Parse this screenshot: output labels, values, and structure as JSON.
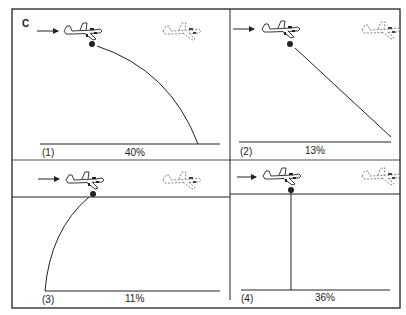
{
  "figure": {
    "corner_label": "C",
    "colors": {
      "line": "#222222",
      "background": "#ffffff",
      "ghost_plane": "#666666"
    }
  },
  "panels": [
    {
      "index": "(1)",
      "percent": "40%",
      "trajectory": "forward-arc",
      "icon": "airplane-icon"
    },
    {
      "index": "(2)",
      "percent": "13%",
      "trajectory": "forward-straight-diagonal",
      "icon": "airplane-icon"
    },
    {
      "index": "(3)",
      "percent": "11%",
      "trajectory": "backward-arc",
      "icon": "airplane-icon"
    },
    {
      "index": "(4)",
      "percent": "36%",
      "trajectory": "straight-down",
      "icon": "airplane-icon"
    }
  ]
}
